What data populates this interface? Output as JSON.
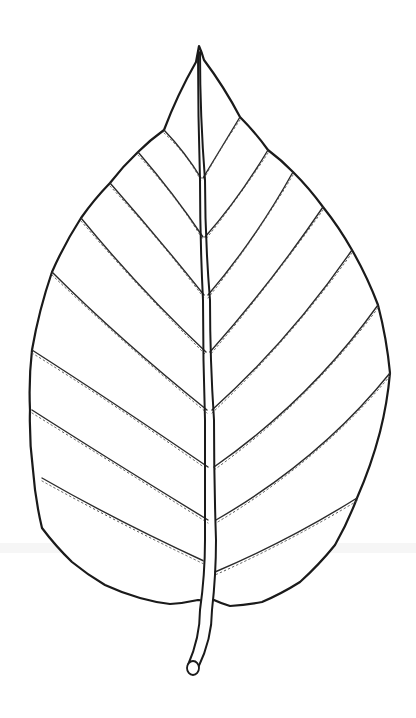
{
  "image": {
    "subject": "leaf line drawing",
    "background": "#ffffff",
    "ink_color": "#1a1a1a",
    "width": 416,
    "height": 718
  },
  "leaf": {
    "tip": [
      199,
      46
    ],
    "outline_points": [
      [
        199,
        46
      ],
      [
        204,
        60
      ],
      [
        240,
        117
      ],
      [
        268,
        150
      ],
      [
        293,
        172
      ],
      [
        323,
        207
      ],
      [
        352,
        250
      ],
      [
        378,
        305
      ],
      [
        390,
        373
      ],
      [
        380,
        432
      ],
      [
        357,
        498
      ],
      [
        335,
        545
      ],
      [
        300,
        582
      ],
      [
        262,
        602
      ],
      [
        230,
        606
      ],
      [
        214,
        600
      ],
      [
        198,
        600
      ],
      [
        170,
        604
      ],
      [
        140,
        598
      ],
      [
        105,
        585
      ],
      [
        72,
        562
      ],
      [
        42,
        528
      ],
      [
        33,
        470
      ],
      [
        30,
        410
      ],
      [
        32,
        350
      ],
      [
        52,
        272
      ],
      [
        81,
        218
      ],
      [
        110,
        183
      ],
      [
        138,
        152
      ],
      [
        164,
        130
      ],
      [
        196,
        62
      ]
    ],
    "midrib": {
      "left": [
        [
          198,
          52
        ],
        [
          200,
          180
        ],
        [
          203,
          300
        ],
        [
          205,
          420
        ],
        [
          205,
          540
        ],
        [
          200,
          610
        ],
        [
          188,
          665
        ]
      ],
      "right": [
        [
          200,
          52
        ],
        [
          205,
          180
        ],
        [
          210,
          300
        ],
        [
          214,
          420
        ],
        [
          216,
          540
        ],
        [
          212,
          610
        ],
        [
          198,
          668
        ]
      ]
    },
    "stem_end": {
      "cx": 193,
      "cy": 668,
      "rx": 6,
      "ry": 7
    },
    "veins_left": [
      {
        "from": [
          164,
          130
        ],
        "ctrl": [
          185,
          152
        ],
        "to": [
          201,
          178
        ]
      },
      {
        "from": [
          138,
          152
        ],
        "ctrl": [
          175,
          195
        ],
        "to": [
          203,
          237
        ]
      },
      {
        "from": [
          110,
          183
        ],
        "ctrl": [
          160,
          240
        ],
        "to": [
          204,
          295
        ]
      },
      {
        "from": [
          81,
          218
        ],
        "ctrl": [
          140,
          290
        ],
        "to": [
          206,
          352
        ]
      },
      {
        "from": [
          52,
          272
        ],
        "ctrl": [
          120,
          340
        ],
        "to": [
          207,
          410
        ]
      },
      {
        "from": [
          32,
          350
        ],
        "ctrl": [
          110,
          400
        ],
        "to": [
          208,
          467
        ]
      },
      {
        "from": [
          32,
          410
        ],
        "ctrl": [
          110,
          460
        ],
        "to": [
          208,
          520
        ]
      },
      {
        "from": [
          42,
          478
        ],
        "ctrl": [
          115,
          520
        ],
        "to": [
          206,
          562
        ]
      }
    ],
    "veins_right": [
      {
        "from": [
          240,
          117
        ],
        "ctrl": [
          220,
          150
        ],
        "to": [
          203,
          178
        ]
      },
      {
        "from": [
          268,
          150
        ],
        "ctrl": [
          238,
          200
        ],
        "to": [
          205,
          237
        ]
      },
      {
        "from": [
          293,
          172
        ],
        "ctrl": [
          255,
          240
        ],
        "to": [
          208,
          295
        ]
      },
      {
        "from": [
          323,
          207
        ],
        "ctrl": [
          270,
          285
        ],
        "to": [
          210,
          352
        ]
      },
      {
        "from": [
          352,
          250
        ],
        "ctrl": [
          290,
          340
        ],
        "to": [
          212,
          410
        ]
      },
      {
        "from": [
          378,
          305
        ],
        "ctrl": [
          310,
          400
        ],
        "to": [
          214,
          467
        ]
      },
      {
        "from": [
          390,
          373
        ],
        "ctrl": [
          320,
          460
        ],
        "to": [
          216,
          520
        ]
      },
      {
        "from": [
          357,
          498
        ],
        "ctrl": [
          290,
          540
        ],
        "to": [
          215,
          572
        ]
      }
    ]
  },
  "artifacts": {
    "scan_band": {
      "y": 543,
      "height": 10,
      "color": "#f2f2f2"
    }
  }
}
